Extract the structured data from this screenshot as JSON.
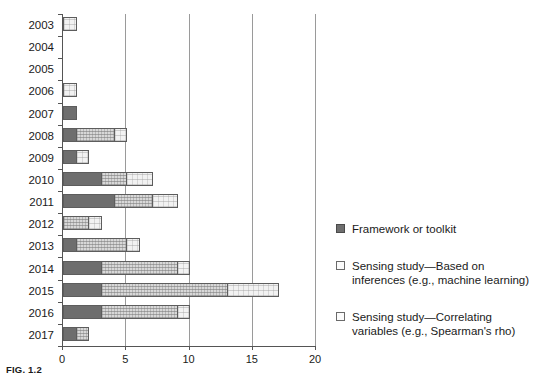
{
  "caption": "FIG. 1.2",
  "chart_data": {
    "type": "bar",
    "orientation": "horizontal",
    "stacked": true,
    "title": "",
    "xlabel": "",
    "ylabel": "",
    "xlim": [
      0,
      20
    ],
    "xticks": [
      0,
      5,
      10,
      15,
      20
    ],
    "xtick_labels": [
      "0",
      "5",
      "10",
      "15",
      "20"
    ],
    "grid": "vertical",
    "legend_position": "right",
    "categories": [
      "2003",
      "2004",
      "2005",
      "2006",
      "2007",
      "2008",
      "2009",
      "2010",
      "2011",
      "2012",
      "2013",
      "2014",
      "2015",
      "2016",
      "2017"
    ],
    "series": [
      {
        "name": "Framework or toolkit",
        "key": "framework",
        "color": "#6e6e6e",
        "values": [
          0,
          0,
          0,
          0,
          1,
          1,
          1,
          3,
          4,
          0,
          1,
          3,
          3,
          3,
          1
        ]
      },
      {
        "name": "Sensing study—Based on inferences (e.g., machine learning)",
        "key": "inference",
        "color": "#d8d8d8",
        "values": [
          0,
          0,
          0,
          0,
          0,
          3,
          0,
          2,
          3,
          2,
          4,
          6,
          10,
          6,
          1
        ]
      },
      {
        "name": "Sensing study—Correlating variables (e.g., Spearman's rho)",
        "key": "correlating",
        "color": "#f2f2f2",
        "values": [
          1,
          0,
          0,
          1,
          0,
          1,
          1,
          2,
          2,
          1,
          1,
          1,
          4,
          1,
          0
        ]
      }
    ],
    "totals": [
      1,
      0,
      0,
      1,
      1,
      5,
      2,
      7,
      9,
      3,
      6,
      10,
      17,
      10,
      2
    ]
  },
  "legend": [
    {
      "key": "framework",
      "label": "Framework or toolkit"
    },
    {
      "key": "inference",
      "label": "Sensing study—Based on inferences (e.g., machine learning)"
    },
    {
      "key": "correlating",
      "label": "Sensing study—Correlating variables (e.g., Spearman's rho)"
    }
  ]
}
